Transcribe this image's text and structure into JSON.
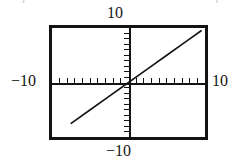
{
  "figure": {
    "name": "graphing-calculator-window",
    "background_color": "#ffffff",
    "ink_color": "#141414",
    "cropped_text_above": {
      "left_fragment": "(",
      "right_fragment": ")"
    }
  },
  "chart_data": {
    "type": "line",
    "title": "",
    "subtitle": "",
    "xlabel": "",
    "ylabel": "",
    "xlim": [
      -10,
      10
    ],
    "ylim": [
      -10,
      10
    ],
    "grid": false,
    "legend": null,
    "axes": {
      "x_axis_visible": true,
      "y_axis_visible": true,
      "x_tick_count": 19,
      "y_tick_count": 15,
      "x_tick_step": 1,
      "y_tick_step": 1
    },
    "tick_labels": {
      "top": "10",
      "left": "−10",
      "right": "10",
      "bottom": "−10"
    },
    "series": [
      {
        "name": "y = x",
        "equation": "y = x",
        "style": "solid",
        "color": "#141414",
        "x": [
          -7.5,
          -5,
          -2.5,
          0,
          2.5,
          5,
          7.5,
          9.5
        ],
        "y": [
          -7.5,
          -5,
          -2.5,
          0,
          2.5,
          5,
          7.5,
          9.5
        ]
      }
    ]
  },
  "labels": {
    "top": "10",
    "left": "−10",
    "right": "10",
    "bottom": "−10"
  }
}
